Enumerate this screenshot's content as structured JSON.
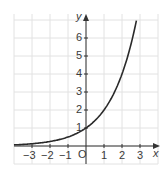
{
  "chart_data": {
    "type": "line",
    "title": "",
    "xlabel": "x",
    "ylabel": "y",
    "function": "y = 2^x",
    "xlim": [
      -4,
      4
    ],
    "ylim": [
      -0.8,
      7.2
    ],
    "grid": true,
    "origin_label": "O",
    "x_ticks": [
      -3,
      -2,
      -1,
      1,
      2,
      3
    ],
    "x_tick_labels": [
      "−3",
      "−2",
      "−1",
      "1",
      "2",
      "3"
    ],
    "y_ticks": [
      1,
      2,
      3,
      4,
      5,
      6
    ],
    "y_tick_labels": [
      "1",
      "2",
      "3",
      "4",
      "5",
      "6"
    ],
    "series": [
      {
        "name": "exponential curve",
        "x": [
          -4,
          -3,
          -2,
          -1,
          0,
          1,
          2,
          2.5,
          2.8
        ],
        "y": [
          0.0625,
          0.125,
          0.25,
          0.5,
          1,
          2,
          4,
          5.66,
          6.96
        ]
      }
    ],
    "colors": {
      "curve": "#2a2a2a",
      "grid": "#e2e2e2",
      "axis": "#333333"
    }
  }
}
